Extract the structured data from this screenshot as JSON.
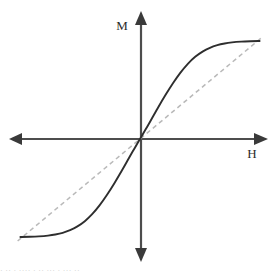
{
  "figure": {
    "background_color": "#ffffff"
  },
  "axes": {
    "vertical_label": "M",
    "horizontal_label": "H",
    "color": "#4d4d4d",
    "arrowhead_color": "#3a3a3a",
    "origin_x": 140,
    "origin_y": 139
  },
  "legend_colors": {
    "curve_color": "#2e2e2e",
    "tangent_color": "#b9b9b9"
  },
  "caption": {
    "clipped_text": "· ·· · ···· · ·· ··· · ··· ··"
  },
  "chart_data": {
    "type": "line",
    "title": "",
    "xlabel": "H",
    "ylabel": "M",
    "xlim": [
      -1.35,
      1.35
    ],
    "ylim": [
      -1.1,
      1.45
    ],
    "grid": false,
    "legend_position": "none",
    "series": [
      {
        "name": "Magnetization curve",
        "style": "solid",
        "color": "#2e2e2e",
        "x": [
          -1.3,
          -1.2,
          -1.1,
          -1.0,
          -0.92,
          -0.84,
          -0.76,
          -0.68,
          -0.6,
          -0.52,
          -0.44,
          -0.36,
          -0.28,
          -0.2,
          -0.12,
          -0.06,
          0.0,
          0.06,
          0.12,
          0.2,
          0.28,
          0.36,
          0.44,
          0.52,
          0.6,
          0.68,
          0.76,
          0.84,
          0.92,
          1.0,
          1.1,
          1.2,
          1.3
        ],
        "y": [
          -0.98,
          -0.978,
          -0.974,
          -0.966,
          -0.955,
          -0.938,
          -0.912,
          -0.874,
          -0.822,
          -0.752,
          -0.664,
          -0.56,
          -0.444,
          -0.32,
          -0.19,
          -0.094,
          0.0,
          0.094,
          0.19,
          0.32,
          0.444,
          0.56,
          0.664,
          0.752,
          0.822,
          0.874,
          0.912,
          0.938,
          0.955,
          0.966,
          0.974,
          0.978,
          0.98
        ],
        "saturation_positive": 0.98,
        "saturation_negative": -0.98,
        "shape": "odd-symmetric sigmoid"
      },
      {
        "name": "Initial susceptibility tangent",
        "style": "dashed",
        "color": "#b9b9b9",
        "x": [
          -1.33,
          1.33
        ],
        "y": [
          -1.02,
          1.02
        ],
        "slope": 0.767,
        "through_origin": true
      }
    ]
  }
}
